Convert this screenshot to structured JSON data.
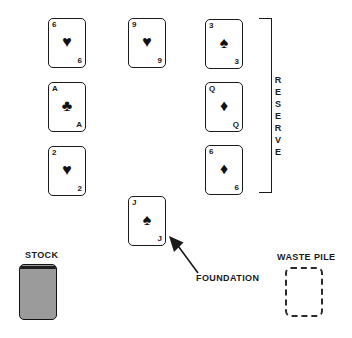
{
  "colors": {
    "ink": "#1a1a1a",
    "stock_fill": "#9b9b9b",
    "paper": "#ffffff"
  },
  "reserve": {
    "label": "RESERVE",
    "cards": [
      {
        "rank": "6",
        "suit": "hearts",
        "suit_char": "♥"
      },
      {
        "rank": "9",
        "suit": "hearts",
        "suit_char": "♥"
      },
      {
        "rank": "3",
        "suit": "spades",
        "suit_char": "♠"
      },
      {
        "rank": "A",
        "suit": "clubs",
        "suit_char": "♣"
      },
      {
        "rank": "Q",
        "suit": "diamonds",
        "suit_char": "♦"
      },
      {
        "rank": "2",
        "suit": "hearts",
        "suit_char": "♥"
      },
      {
        "rank": "6",
        "suit": "diamonds",
        "suit_char": "♦"
      }
    ]
  },
  "foundation": {
    "label": "FOUNDATION",
    "card": {
      "rank": "J",
      "suit": "spades",
      "suit_char": "♠"
    }
  },
  "stock": {
    "label": "STOCK"
  },
  "waste": {
    "label": "WASTE PILE"
  }
}
